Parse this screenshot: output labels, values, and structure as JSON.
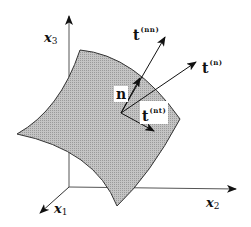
{
  "diagram": {
    "type": "traction vector decomposition on a surface",
    "axes": {
      "x1": {
        "symbol": "x",
        "subscript": "1"
      },
      "x2": {
        "symbol": "x",
        "subscript": "2"
      },
      "x3": {
        "symbol": "x",
        "subscript": "3"
      }
    },
    "vectors": {
      "normal": {
        "symbol": "n"
      },
      "traction": {
        "symbol": "t",
        "superscript": "(n)"
      },
      "normal_component": {
        "symbol": "t",
        "superscript": "(nn)"
      },
      "tangential_component": {
        "symbol": "t",
        "superscript": "(nt)"
      }
    },
    "colors": {
      "surface_fill": "#b5b5b5",
      "surface_edge": "#333333",
      "lines": "#222222",
      "background": "#ffffff"
    }
  }
}
